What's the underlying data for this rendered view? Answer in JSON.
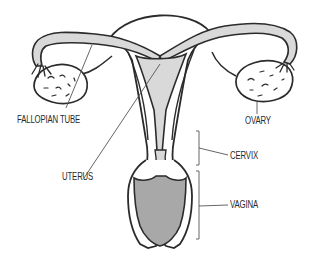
{
  "diagram": {
    "colors": {
      "outline": "#2b2b2b",
      "tube_fill": "#d9d9d9",
      "vagina_fill": "#a8a8a8",
      "leader_line": "#555555",
      "background": "#ffffff"
    },
    "labels": {
      "fallopian_tube": "FALLOPIAN TUBE",
      "ovary": "OVARY",
      "uterus": "UTERUS",
      "cervix": "CERVIX",
      "vagina": "VAGINA"
    }
  }
}
